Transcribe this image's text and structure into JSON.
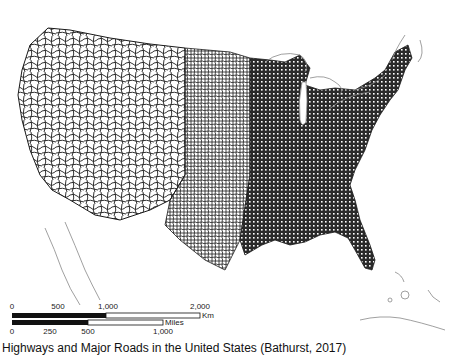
{
  "map": {
    "title_caption": "Highways and Major Roads in the United States (Bathurst, 2017)",
    "subject": "contiguous-united-states-road-network",
    "colors": {
      "roads": "#1a1a1a",
      "coastline": "#888888",
      "background": "#ffffff"
    }
  },
  "scale_bar": {
    "km": {
      "unit": "Km",
      "ticks": [
        "0",
        "500",
        "1,000",
        "2,000"
      ]
    },
    "miles": {
      "unit": "Miles",
      "ticks": [
        "0",
        "250",
        "500",
        "1,000"
      ]
    }
  }
}
